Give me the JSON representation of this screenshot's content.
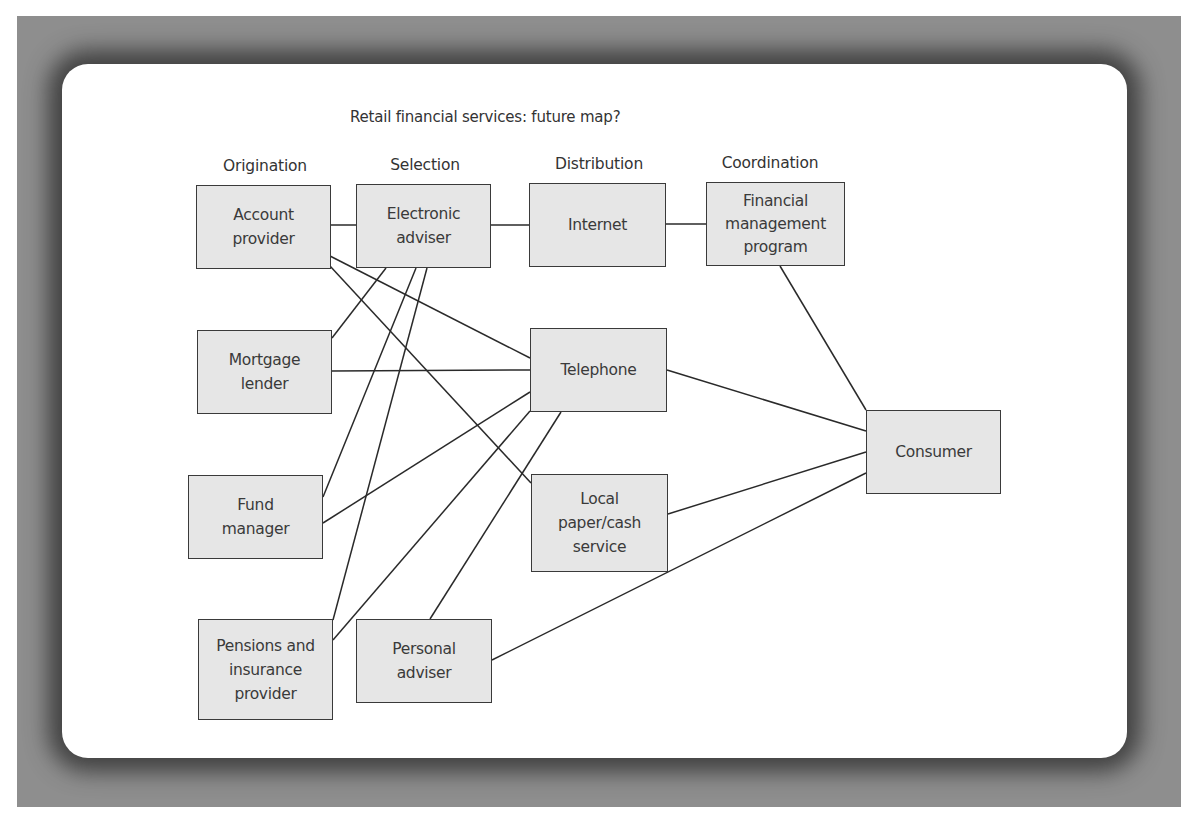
{
  "diagram": {
    "title": "Retail financial services: future map?",
    "columns": [
      {
        "label": "Origination",
        "x": 265,
        "y": 157
      },
      {
        "label": "Selection",
        "x": 425,
        "y": 156
      },
      {
        "label": "Distribution",
        "x": 599,
        "y": 155
      },
      {
        "label": "Coordination",
        "x": 770,
        "y": 154
      }
    ],
    "nodes": [
      {
        "id": "account_provider",
        "label": "Account\nprovider",
        "x": 196,
        "y": 185,
        "w": 135,
        "h": 84
      },
      {
        "id": "electronic_adviser",
        "label": "Electronic\nadviser",
        "x": 356,
        "y": 184,
        "w": 135,
        "h": 84
      },
      {
        "id": "internet",
        "label": "Internet",
        "x": 529,
        "y": 183,
        "w": 137,
        "h": 84
      },
      {
        "id": "financial_management_program",
        "label": "Financial\nmanagement\nprogram",
        "x": 706,
        "y": 182,
        "w": 139,
        "h": 84
      },
      {
        "id": "mortgage_lender",
        "label": "Mortgage\nlender",
        "x": 197,
        "y": 330,
        "w": 135,
        "h": 84
      },
      {
        "id": "telephone",
        "label": "Telephone",
        "x": 530,
        "y": 328,
        "w": 137,
        "h": 84
      },
      {
        "id": "fund_manager",
        "label": "Fund\nmanager",
        "x": 188,
        "y": 475,
        "w": 135,
        "h": 84
      },
      {
        "id": "local_paper_cash_service",
        "label": "Local\npaper/cash\nservice",
        "x": 531,
        "y": 474,
        "w": 137,
        "h": 98
      },
      {
        "id": "consumer",
        "label": "Consumer",
        "x": 866,
        "y": 410,
        "w": 135,
        "h": 84
      },
      {
        "id": "pensions_insurance_provider",
        "label": "Pensions and\ninsurance\nprovider",
        "x": 198,
        "y": 619,
        "w": 135,
        "h": 101
      },
      {
        "id": "personal_adviser",
        "label": "Personal\nadviser",
        "x": 356,
        "y": 619,
        "w": 136,
        "h": 84
      }
    ],
    "edges": [
      {
        "from": "account_provider",
        "to": "electronic_adviser",
        "x1": 331,
        "y1": 225,
        "x2": 356,
        "y2": 225
      },
      {
        "from": "electronic_adviser",
        "to": "internet",
        "x1": 491,
        "y1": 225,
        "x2": 529,
        "y2": 225
      },
      {
        "from": "internet",
        "to": "financial_management_program",
        "x1": 666,
        "y1": 224,
        "x2": 706,
        "y2": 224
      },
      {
        "from": "account_provider",
        "to": "telephone",
        "x1": 330,
        "y1": 256,
        "x2": 530,
        "y2": 358
      },
      {
        "from": "account_provider",
        "to": "local_paper_cash_service",
        "x1": 330,
        "y1": 266,
        "x2": 531,
        "y2": 483
      },
      {
        "from": "electronic_adviser",
        "to": "mortgage_lender",
        "x1": 386,
        "y1": 268,
        "x2": 332,
        "y2": 338
      },
      {
        "from": "electronic_adviser",
        "to": "fund_manager",
        "x1": 416,
        "y1": 268,
        "x2": 323,
        "y2": 497
      },
      {
        "from": "electronic_adviser",
        "to": "pensions_insurance_provider",
        "x1": 427,
        "y1": 268,
        "x2": 333,
        "y2": 620
      },
      {
        "from": "mortgage_lender",
        "to": "telephone",
        "x1": 332,
        "y1": 371,
        "x2": 530,
        "y2": 370
      },
      {
        "from": "fund_manager",
        "to": "telephone",
        "x1": 323,
        "y1": 523,
        "x2": 530,
        "y2": 392
      },
      {
        "from": "pensions_insurance_provider",
        "to": "telephone",
        "x1": 333,
        "y1": 640,
        "x2": 530,
        "y2": 411
      },
      {
        "from": "personal_adviser",
        "to": "telephone",
        "x1": 430,
        "y1": 619,
        "x2": 561,
        "y2": 412
      },
      {
        "from": "financial_management_program",
        "to": "consumer",
        "x1": 780,
        "y1": 266,
        "x2": 866,
        "y2": 410
      },
      {
        "from": "telephone",
        "to": "consumer",
        "x1": 667,
        "y1": 370,
        "x2": 866,
        "y2": 431
      },
      {
        "from": "local_paper_cash_service",
        "to": "consumer",
        "x1": 668,
        "y1": 514,
        "x2": 866,
        "y2": 452
      },
      {
        "from": "personal_adviser",
        "to": "consumer",
        "x1": 492,
        "y1": 660,
        "x2": 866,
        "y2": 473
      }
    ]
  },
  "colors": {
    "frame": "#8e8e8e",
    "panel": "#ffffff",
    "node_fill": "#e6e6e6",
    "node_border": "#3a3a3a",
    "edge": "#2a2a2a",
    "text": "#333333"
  }
}
